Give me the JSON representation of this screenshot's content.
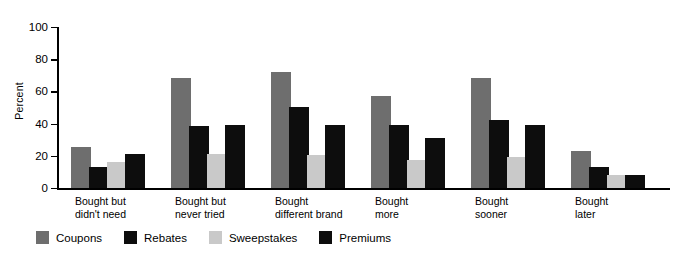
{
  "chart_data": {
    "type": "bar",
    "title": "",
    "xlabel": "",
    "ylabel": "Percent",
    "ylim": [
      0,
      100
    ],
    "yticks": [
      0,
      20,
      40,
      60,
      80,
      100
    ],
    "grid": false,
    "legend_position": "bottom-left",
    "categories": [
      "Bought but\ndidn't need",
      "Bought but\nnever tried",
      "Bought\ndifferent brand",
      "Bought\nmore",
      "Bought\nsooner",
      "Bought\nlater"
    ],
    "series": [
      {
        "name": "Coupons",
        "color": "#6e6e6e",
        "values": [
          24,
          67,
          71,
          56,
          67,
          22
        ]
      },
      {
        "name": "Rebates",
        "color": "#0d0d0d",
        "values": [
          12,
          37,
          49,
          38,
          41,
          12
        ]
      },
      {
        "name": "Sweepstakes",
        "color": "#c9c9c9",
        "values": [
          15,
          20,
          19,
          16,
          18,
          7
        ]
      },
      {
        "name": "Premiums",
        "color": "#0d0d0d",
        "values": [
          20,
          38,
          38,
          30,
          38,
          7
        ]
      }
    ]
  },
  "axis": {
    "y_title": "Percent",
    "y_tick_labels": [
      "0",
      "20",
      "40",
      "60",
      "80",
      "100"
    ]
  },
  "legend": {
    "items": [
      {
        "label": "Coupons",
        "swatch": "#6e6e6e"
      },
      {
        "label": "Rebates",
        "swatch": "#0d0d0d"
      },
      {
        "label": "Sweepstakes",
        "swatch": "#c9c9c9"
      },
      {
        "label": "Premiums",
        "swatch": "#0d0d0d"
      }
    ]
  }
}
